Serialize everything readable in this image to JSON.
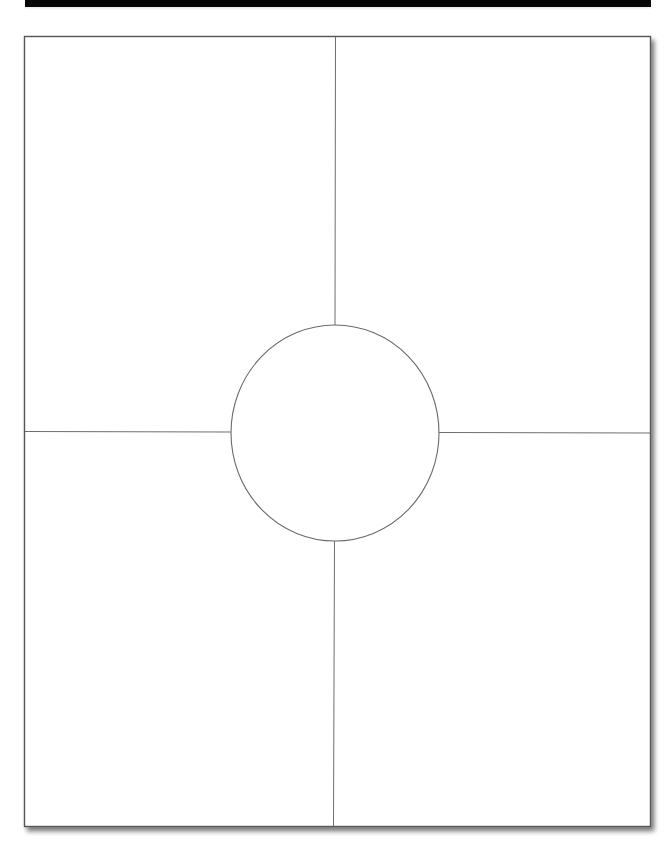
{
  "document": {
    "type": "four-square graphic organizer template",
    "header_bar_color": "#050505",
    "frame": {
      "x": 24,
      "y": 36,
      "width": 627,
      "height": 791,
      "stroke": "#555555"
    },
    "dividers": {
      "vertical_x": 334,
      "horizontal_y": 432,
      "stroke": "#6e6e6e"
    },
    "center_circle": {
      "cx": 335,
      "cy": 433,
      "r": 106,
      "stroke": "#6a6a6a",
      "fill": "#ffffff",
      "label": ""
    },
    "quadrants": [
      {
        "position": "top-left",
        "label": ""
      },
      {
        "position": "top-right",
        "label": ""
      },
      {
        "position": "bottom-left",
        "label": ""
      },
      {
        "position": "bottom-right",
        "label": ""
      }
    ]
  }
}
